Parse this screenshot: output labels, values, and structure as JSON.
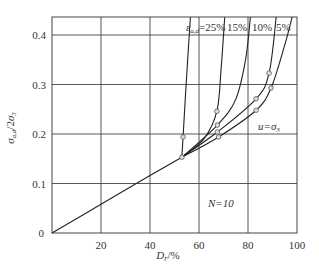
{
  "chart_data": {
    "type": "line",
    "title": "",
    "xlabel": "D_r/%",
    "ylabel": "σ_a,d/2σ_3",
    "xlim": [
      0,
      100
    ],
    "ylim": [
      0,
      0.436
    ],
    "grid": true,
    "xticks": [
      "20",
      "40",
      "60",
      "80",
      "100"
    ],
    "yticks": [
      "0",
      "0.1",
      "0.2",
      "0.3",
      "0.4"
    ],
    "origin_label": "0",
    "annotation": "N=10",
    "legend_inline": {
      "prefix": "ε_a,d=",
      "labels": [
        "25%",
        "15%",
        "10%",
        "5%"
      ]
    },
    "series": [
      {
        "name": "common",
        "x": [
          0,
          20,
          40,
          53
        ],
        "y": [
          0,
          0.058,
          0.116,
          0.153
        ]
      },
      {
        "name": "ε=25%",
        "x": [
          53,
          53.5,
          54.5,
          55.5,
          56.5
        ],
        "y": [
          0.153,
          0.194,
          0.28,
          0.36,
          0.436
        ]
      },
      {
        "name": "ε=15%",
        "x": [
          53,
          62,
          67.3,
          69,
          70.5
        ],
        "y": [
          0.153,
          0.19,
          0.246,
          0.33,
          0.436
        ]
      },
      {
        "name": "ε=10%",
        "x": [
          53,
          67.5,
          75,
          79,
          81
        ],
        "y": [
          0.153,
          0.218,
          0.27,
          0.35,
          0.436
        ]
      },
      {
        "name": "ε=5%",
        "x": [
          53,
          67.5,
          83.3,
          88.6,
          91.5
        ],
        "y": [
          0.153,
          0.204,
          0.271,
          0.323,
          0.436
        ]
      },
      {
        "name": "u=σ3",
        "x": [
          53,
          68,
          83.3,
          89.4,
          95,
          98
        ],
        "y": [
          0.153,
          0.194,
          0.248,
          0.293,
          0.38,
          0.436
        ]
      }
    ],
    "markers": [
      [
        53,
        0.153
      ],
      [
        53.5,
        0.194
      ],
      [
        67.3,
        0.246
      ],
      [
        67.5,
        0.218
      ],
      [
        67.5,
        0.204
      ],
      [
        68,
        0.194
      ],
      [
        83.3,
        0.271
      ],
      [
        83.3,
        0.248
      ],
      [
        88.6,
        0.323
      ],
      [
        89.4,
        0.293
      ]
    ],
    "series_label": "u=σ3"
  }
}
